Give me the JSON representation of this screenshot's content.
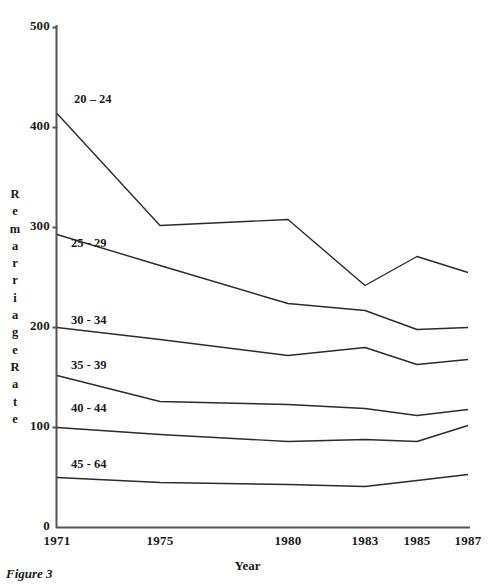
{
  "figure": {
    "caption": "Figure 3"
  },
  "chart_data": {
    "type": "line",
    "title": "",
    "xlabel": "Year",
    "ylabel": "Remarriage Rate",
    "ylabel_letters": [
      "R",
      "e",
      "m",
      "a",
      "r",
      "r",
      "i",
      "a",
      "g",
      "e",
      "R",
      "a",
      "t",
      "e"
    ],
    "x": [
      1971,
      1975,
      1980,
      1983,
      1985,
      1987
    ],
    "categories": [
      "1971",
      "1975",
      "1980",
      "1983",
      "1985",
      "1987"
    ],
    "xtick_labels": [
      "1971",
      "1975",
      "1980",
      "1983",
      "1985",
      "1987"
    ],
    "ytick_labels": [
      "0",
      "100",
      "200",
      "300",
      "400",
      "500"
    ],
    "yticks": [
      0,
      100,
      200,
      300,
      400,
      500
    ],
    "ylim": [
      0,
      500
    ],
    "xlim": [
      1971,
      1987
    ],
    "grid": false,
    "legend": "inline-series-labels",
    "line_color": "#2b2b2b",
    "axis_color": "#555555",
    "series": [
      {
        "name": "20 - 24",
        "label": "20 – 24",
        "values": [
          414,
          302,
          308,
          242,
          271,
          255
        ]
      },
      {
        "name": "25 - 29",
        "label": "25 - 29",
        "values": [
          293,
          262,
          224,
          217,
          198,
          200
        ]
      },
      {
        "name": "30 - 34",
        "label": "30 - 34",
        "values": [
          200,
          188,
          172,
          180,
          163,
          168
        ]
      },
      {
        "name": "35 - 39",
        "label": "35 - 39",
        "values": [
          152,
          126,
          123,
          119,
          112,
          118
        ]
      },
      {
        "name": "40 - 44",
        "label": "40 - 44",
        "values": [
          100,
          93,
          86,
          88,
          86,
          102
        ]
      },
      {
        "name": "45 - 64",
        "label": "45 - 64",
        "values": [
          50,
          45,
          43,
          41,
          47,
          53
        ]
      }
    ]
  }
}
